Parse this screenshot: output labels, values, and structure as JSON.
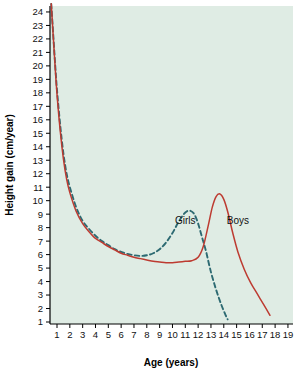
{
  "chart_data": {
    "type": "line",
    "title": "",
    "xlabel": "Age (years)",
    "ylabel": "Height gain (cm/year)",
    "xlim": [
      0.4,
      19.4
    ],
    "ylim": [
      0.4,
      24.6
    ],
    "grid": false,
    "legend_position": "inline-annotations",
    "plot_background": "#dfece4",
    "x_ticks": [
      1,
      2,
      3,
      4,
      5,
      6,
      7,
      8,
      9,
      10,
      11,
      12,
      13,
      14,
      15,
      16,
      17,
      18,
      19
    ],
    "x_tick_labels": [
      "1",
      "2",
      "3",
      "4",
      "5",
      "6",
      "7",
      "8",
      "9",
      "10",
      "11",
      "12",
      "13",
      "14",
      "15",
      "16",
      "17",
      "18",
      "19"
    ],
    "y_ticks": [
      1,
      2,
      3,
      4,
      5,
      6,
      7,
      8,
      9,
      10,
      11,
      12,
      13,
      14,
      15,
      16,
      17,
      18,
      19,
      20,
      21,
      22,
      23,
      24
    ],
    "y_tick_labels": [
      "1",
      "2",
      "3",
      "4",
      "5",
      "6",
      "7",
      "8",
      "9",
      "10",
      "11",
      "12",
      "13",
      "14",
      "15",
      "16",
      "17",
      "18",
      "19",
      "20",
      "21",
      "22",
      "23",
      "24"
    ],
    "series": [
      {
        "name": "Girls",
        "style": "dashed",
        "color": "#2d6a72",
        "label_text": "Girls",
        "label_x": 11.0,
        "label_y": 8.3,
        "x": [
          0.55,
          0.7,
          0.85,
          1.0,
          1.25,
          1.5,
          1.75,
          2.0,
          2.5,
          3.0,
          3.5,
          4.0,
          4.5,
          5.0,
          5.5,
          6.0,
          6.5,
          7.0,
          7.5,
          8.0,
          8.5,
          9.0,
          9.5,
          10.0,
          10.4,
          10.8,
          11.1,
          11.4,
          11.7,
          12.0,
          12.3,
          12.6,
          13.0,
          13.4,
          13.8,
          14.1,
          14.3
        ],
        "y": [
          24.6,
          22.4,
          20.2,
          18.2,
          15.6,
          13.5,
          12.0,
          11.0,
          9.5,
          8.5,
          7.9,
          7.4,
          7.0,
          6.7,
          6.4,
          6.2,
          6.05,
          5.95,
          5.9,
          5.95,
          6.1,
          6.4,
          6.9,
          7.6,
          8.3,
          8.9,
          9.2,
          9.25,
          9.0,
          8.3,
          7.3,
          6.3,
          4.7,
          3.4,
          2.3,
          1.6,
          1.2
        ]
      },
      {
        "name": "Boys",
        "style": "solid",
        "color": "#bd3b31",
        "label_text": "Boys",
        "label_x": 15.1,
        "label_y": 8.3,
        "x": [
          0.55,
          0.7,
          0.85,
          1.0,
          1.25,
          1.5,
          1.75,
          2.0,
          2.5,
          3.0,
          3.5,
          4.0,
          4.5,
          5.0,
          5.5,
          6.0,
          6.5,
          7.0,
          7.5,
          8.0,
          8.5,
          9.0,
          9.5,
          10.0,
          10.5,
          11.0,
          11.5,
          12.0,
          12.4,
          12.8,
          13.1,
          13.4,
          13.7,
          14.0,
          14.3,
          14.7,
          15.1,
          15.6,
          16.1,
          16.6,
          17.1,
          17.6
        ],
        "y": [
          24.6,
          22.3,
          20.0,
          17.9,
          15.2,
          13.1,
          11.6,
          10.6,
          9.2,
          8.3,
          7.7,
          7.2,
          6.9,
          6.6,
          6.35,
          6.1,
          5.95,
          5.8,
          5.7,
          5.6,
          5.5,
          5.45,
          5.4,
          5.4,
          5.45,
          5.5,
          5.55,
          5.8,
          6.6,
          8.2,
          9.5,
          10.3,
          10.5,
          10.1,
          9.2,
          7.6,
          6.2,
          4.9,
          3.9,
          3.1,
          2.3,
          1.5
        ]
      }
    ]
  },
  "axes": {
    "x_title": "Age (years)",
    "y_title": "Height gain (cm/year)"
  }
}
